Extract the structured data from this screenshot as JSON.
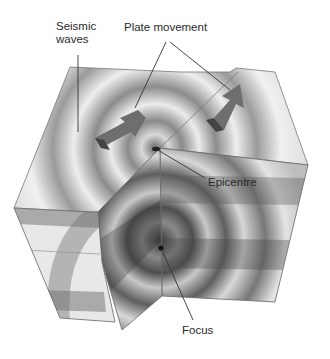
{
  "diagram": {
    "labels": {
      "seismic_waves": "Seismic\nwaves",
      "plate_movement": "Plate movement",
      "epicentre": "Epicentre",
      "focus": "Focus"
    },
    "colors": {
      "background": "#ffffff",
      "light_surface": "#e6e6e6",
      "mid_band": "#9a9a9a",
      "dark_band": "#5a5a5a",
      "arrow": "#6e6e6e",
      "leader_line": "#333333",
      "text": "#2a2a2a"
    }
  }
}
